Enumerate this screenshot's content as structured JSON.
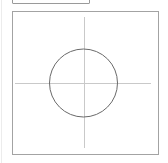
{
  "diagram": {
    "top_box": {
      "label": ""
    },
    "canvas": {
      "frame_color": "#a3a3a3",
      "crosshair": {
        "color": "#c9c9c9",
        "horizontal": {
          "x1": 15,
          "x2": 151,
          "y": 83
        },
        "vertical": {
          "x": 84,
          "y1": 17,
          "y2": 148
        }
      },
      "circle": {
        "cx": 83.5,
        "cy": 83,
        "r": 34,
        "stroke": "#6a6a6a"
      }
    }
  }
}
